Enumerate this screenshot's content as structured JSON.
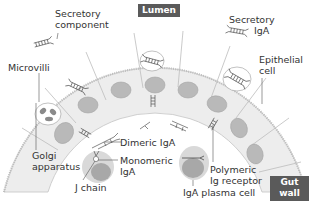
{
  "diagram": {
    "title_tags": {
      "lumen": "Lumen",
      "gut_wall_line1": "Gut",
      "gut_wall_line2": "wall"
    },
    "labels": {
      "secretory_component_line1": "Secretory",
      "secretory_component_line2": "component",
      "secretory_iga_line1": "Secretory",
      "secretory_iga_line2": "IgA",
      "microvilli": "Microvilli",
      "epithelial_cell_line1": "Epithelial",
      "epithelial_cell_line2": "cell",
      "golgi_line1": "Golgi",
      "golgi_line2": "apparatus",
      "dimeric_iga": "Dimeric IgA",
      "monomeric_iga_line1": "Monomeric",
      "monomeric_iga_line2": "IgA",
      "j_chain": "J chain",
      "polymeric_receptor_line1": "Polymeric",
      "polymeric_receptor_line2": "Ig receptor",
      "plasma_cell": "IgA plasma cell"
    },
    "colors": {
      "cell_fill": "#ececec",
      "cell_border": "#b8b8b8",
      "nucleus": "#b9b9b9",
      "tag_bg": "#5a5a5a",
      "plasma_outer": "#d9d9d9",
      "plasma_inner": "#a8a8a8",
      "text": "#333333"
    }
  }
}
